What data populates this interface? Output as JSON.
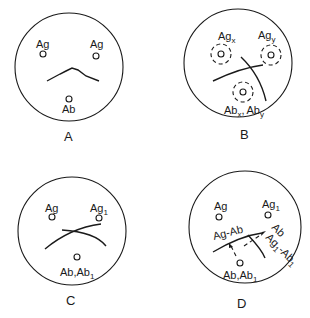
{
  "panels": {
    "A": {
      "label": "A",
      "wells": [
        {
          "name": "Ag",
          "text": "Ag"
        },
        {
          "name": "Ag",
          "text": "Ag"
        },
        {
          "name": "Ab",
          "text": "Ab"
        }
      ]
    },
    "B": {
      "label": "B",
      "ag_x": {
        "base": "Ag",
        "sub": "x"
      },
      "ag_y": {
        "base": "Ag",
        "sub": "y"
      },
      "ab": {
        "base1": "Ab",
        "sub1": "x",
        "sep": ",",
        "base2": "Ab",
        "sub2": "y"
      }
    },
    "C": {
      "label": "C",
      "ag": "Ag",
      "ag1": {
        "base": "Ag",
        "sub": "1"
      },
      "ab": {
        "base1": "Ab",
        "sep": ",",
        "base2": "Ab",
        "sub2": "1"
      }
    },
    "D": {
      "label": "D",
      "ag": "Ag",
      "ag1": {
        "base": "Ag",
        "sub": "1"
      },
      "ab": {
        "base1": "Ab",
        "sep": ",",
        "base2": "Ab",
        "sub2": "1"
      },
      "complex1": "Ag-Ab",
      "complex2": {
        "base": "Ag",
        "sub": "1",
        "rest": "-Ab",
        "sub2": "1"
      },
      "arrow_label": "Ab"
    }
  }
}
